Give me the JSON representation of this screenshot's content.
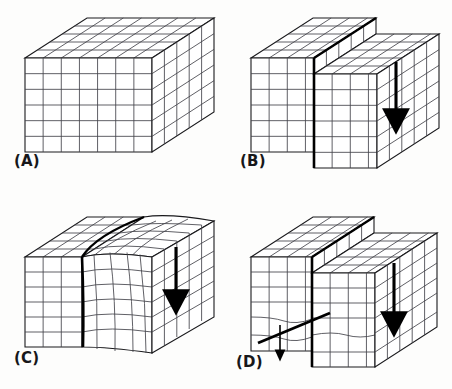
{
  "figure": {
    "background_color": "#fdfdfc",
    "ink_color": "#1a1a1d",
    "grid_color": "#43434a",
    "accent_color": "#000000",
    "panel_count": 4
  },
  "panels": [
    {
      "id": "A",
      "label": "(A)",
      "caption": "Undeformed block with regular orthogonal grid",
      "deformation": "none",
      "grid_columns": 7,
      "grid_rows": 6,
      "grid_depth": 5,
      "has_fault_line": false,
      "has_arrow": false,
      "arrow_count": 0
    },
    {
      "id": "B",
      "label": "(B)",
      "caption": "Brittle fault: right block displaced downward, sharp offset and scarp",
      "deformation": "brittle-fault",
      "grid_columns": 7,
      "grid_rows": 6,
      "grid_depth": 5,
      "has_fault_line": true,
      "fault_style": "vertical-discrete",
      "throw_cells": 1,
      "has_arrow": true,
      "arrow_count": 1,
      "arrow_direction": "down"
    },
    {
      "id": "C",
      "label": "(C)",
      "caption": "Ductile shear zone: grid lines bend continuously, no discrete break",
      "deformation": "ductile-shear",
      "grid_columns": 7,
      "grid_rows": 6,
      "grid_depth": 5,
      "has_fault_line": true,
      "fault_style": "curved-shear-zone",
      "throw_cells": 1,
      "has_arrow": true,
      "arrow_count": 1,
      "arrow_direction": "down"
    },
    {
      "id": "D",
      "label": "(D)",
      "caption": "Combined brittle fault with drag folding along a second oblique fault",
      "deformation": "brittle-ductile-combined",
      "grid_columns": 7,
      "grid_rows": 6,
      "grid_depth": 5,
      "has_fault_line": true,
      "fault_style": "vertical-plus-oblique",
      "throw_cells": 1,
      "has_arrow": true,
      "arrow_count": 2,
      "arrow_direction": "down",
      "secondary_fault": "oblique-drag"
    }
  ]
}
